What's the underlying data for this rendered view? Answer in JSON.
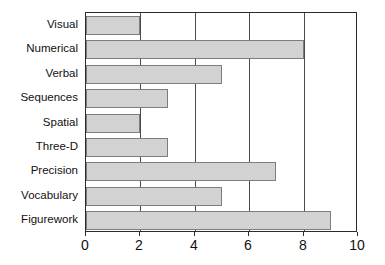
{
  "chart_data": {
    "type": "bar",
    "orientation": "horizontal",
    "title": "",
    "xlabel": "",
    "ylabel": "",
    "categories": [
      "Visual",
      "Numerical",
      "Verbal",
      "Sequences",
      "Spatial",
      "Three-D",
      "Precision",
      "Vocabulary",
      "Figurework"
    ],
    "values": [
      2,
      8,
      5,
      3,
      2,
      3,
      7,
      5,
      9
    ],
    "xlim": [
      0,
      10
    ],
    "xticks": [
      "0",
      "2",
      "4",
      "6",
      "8",
      "10"
    ],
    "xtick_values": [
      0,
      2,
      4,
      6,
      8,
      10
    ],
    "grid": "vertical",
    "legend": "none",
    "colors": {
      "bar_fill": "#d2d2d2",
      "bar_border": "#7d7d7d",
      "axis": "#2b2b2b",
      "gridline": "#4a4a4a",
      "text": "#111111",
      "background": "#ffffff"
    }
  }
}
